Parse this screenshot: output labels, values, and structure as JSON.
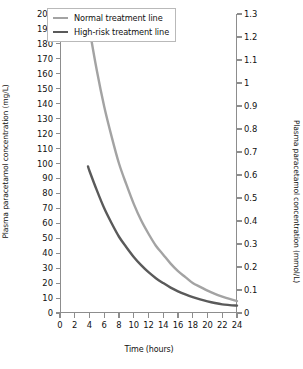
{
  "chart_data": {
    "type": "line",
    "title": "",
    "xlabel": "Time (hours)",
    "ylabel": "Plasma paracetamol concentration (mg/L)",
    "ylabel_right": "Plasma paracetamol concentration (mmol/L)",
    "xlim": [
      0,
      24
    ],
    "ylim": [
      0,
      200
    ],
    "ylim_right": [
      0,
      1.3
    ],
    "grid": false,
    "legend_position": "top-left",
    "xticks": [
      0,
      2,
      4,
      6,
      8,
      10,
      12,
      14,
      16,
      18,
      20,
      22,
      24
    ],
    "xticklabels": [
      "0",
      "2",
      "4",
      "6",
      "8",
      "10",
      "12",
      "14",
      "16",
      "18",
      "20",
      "22",
      "24"
    ],
    "yticks": [
      0,
      10,
      20,
      30,
      40,
      50,
      60,
      70,
      80,
      90,
      100,
      110,
      120,
      130,
      140,
      150,
      160,
      170,
      180,
      190,
      200
    ],
    "yticklabels": [
      "0",
      "10",
      "20",
      "30",
      "40",
      "50",
      "60",
      "70",
      "80",
      "90",
      "100",
      "110",
      "120",
      "130",
      "140",
      "150",
      "160",
      "170",
      "180",
      "190",
      "200"
    ],
    "yticks_right": [
      0,
      0.1,
      0.2,
      0.3,
      0.4,
      0.5,
      0.6,
      0.7,
      0.8,
      0.9,
      1.0,
      1.1,
      1.2,
      1.3
    ],
    "yticklabels_right": [
      "0",
      "0.1",
      "0.2",
      "0.3",
      "0.4",
      "0.5",
      "0.6",
      "0.7",
      "0.8",
      "0.9",
      "1",
      "1.1",
      "1.2",
      "1.3"
    ],
    "series": [
      {
        "name": "Normal treatment line",
        "color": "#a3a3a3",
        "x": [
          3.7,
          4,
          5,
          6,
          7,
          8,
          9,
          10,
          11,
          12,
          13,
          14,
          15,
          16,
          17,
          18,
          19,
          20,
          21,
          22,
          23,
          24
        ],
        "values": [
          200,
          190,
          162,
          138,
          118,
          100,
          86,
          73,
          62,
          53,
          45,
          39,
          33,
          28,
          24,
          20,
          17.5,
          15,
          12.8,
          11,
          9.4,
          8
        ]
      },
      {
        "name": "High-risk treatment line",
        "color": "#5a5a5a",
        "x": [
          3.8,
          4,
          5,
          6,
          7,
          8,
          9,
          10,
          11,
          12,
          13,
          14,
          15,
          16,
          17,
          18,
          19,
          20,
          21,
          22,
          23,
          24
        ],
        "values": [
          98,
          95,
          82,
          70,
          60,
          51,
          44,
          37.5,
          32,
          27.3,
          23.3,
          20,
          17,
          14.5,
          12.4,
          10.6,
          9.1,
          7.8,
          6.7,
          5.8,
          5.3,
          4.9
        ]
      }
    ]
  },
  "legend": {
    "items": [
      {
        "label": "Normal treatment line",
        "color": "#a3a3a3"
      },
      {
        "label": "High-risk treatment line",
        "color": "#5a5a5a"
      }
    ]
  }
}
